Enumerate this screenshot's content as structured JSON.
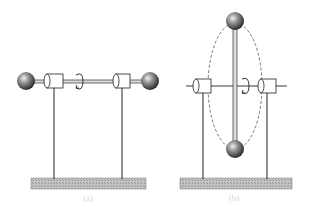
{
  "figure": {
    "panels": [
      {
        "id": "a",
        "label": "(a)",
        "description": "Dumbbell rotating about its own long axis (horizontal rod in bearings)",
        "rotation_axis": "horizontal",
        "rotation_arrow_icon": "curved-rotation-arrow"
      },
      {
        "id": "b",
        "label": "(b)",
        "description": "Dumbbell rotating about horizontal axis perpendicular to rod; dashed ellipse shows path of masses",
        "rotation_axis": "horizontal",
        "rotation_arrow_icon": "curved-rotation-arrow"
      }
    ],
    "colors": {
      "line": "#222222",
      "base": "#b8b8b8",
      "sphere_dark": "#2a2a2a",
      "sphere_light": "#e0e0e0",
      "dashed_path": "#555555"
    }
  }
}
